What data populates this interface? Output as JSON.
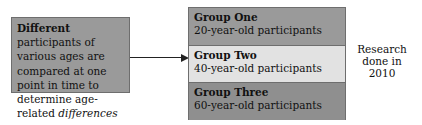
{
  "left_box": {
    "bold_lead": "Different",
    "text_mid": " participants of various ages are compared at one point in time to determine age-related ",
    "italic_tail": "differences"
  },
  "groups": [
    {
      "title": "Group One",
      "subtitle": "20-year-old participants",
      "shade": "dark"
    },
    {
      "title": "Group Two",
      "subtitle": "40-year-old participants",
      "shade": "light"
    },
    {
      "title": "Group Three",
      "subtitle": "60-year-old participants",
      "shade": "dark"
    }
  ],
  "side_note": {
    "line1": "Research",
    "line2": "done in",
    "line3": "2010"
  },
  "colors": {
    "dark_fill": "#9a9a9a",
    "light_fill": "#e2e2e2",
    "border": "#6e6e6e"
  }
}
